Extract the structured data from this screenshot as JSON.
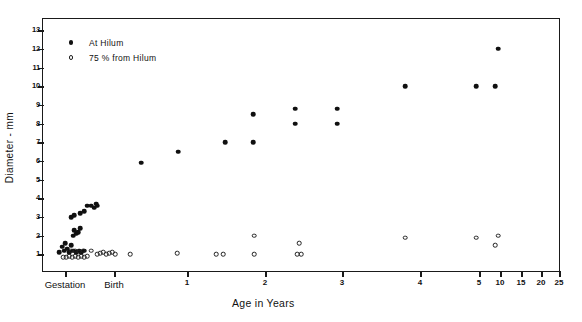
{
  "chart_data": {
    "type": "scatter",
    "title": "",
    "xlabel": "Age in Years",
    "ylabel": "Diameter - mm",
    "ylim": [
      0,
      13.6
    ],
    "ytick_labels": [
      "1",
      "2",
      "3",
      "4",
      "5",
      "6",
      "7",
      "8",
      "9",
      "10",
      "11",
      "12",
      "13"
    ],
    "ytick_values": [
      1,
      2,
      3,
      4,
      5,
      6,
      7,
      8,
      9,
      10,
      11,
      12,
      13
    ],
    "xtick_labels": [
      "Gestation",
      "Birth",
      "1",
      "2",
      "3",
      "4",
      "5",
      "10",
      "15",
      "20",
      "25"
    ],
    "xtick_positions_px": [
      64,
      113,
      186,
      264,
      341,
      419,
      478,
      499,
      520,
      540,
      558
    ],
    "grid": false,
    "legend_position": "top-left",
    "series": [
      {
        "name": "At Hilum",
        "marker": "filled-circle",
        "points": [
          {
            "x_px": 58,
            "y": 1.1
          },
          {
            "x_px": 61,
            "y": 1.4
          },
          {
            "x_px": 63,
            "y": 1.2
          },
          {
            "x_px": 64,
            "y": 1.6
          },
          {
            "x_px": 66,
            "y": 1.3
          },
          {
            "x_px": 68,
            "y": 1.1
          },
          {
            "x_px": 70,
            "y": 1.5
          },
          {
            "x_px": 72,
            "y": 1.2
          },
          {
            "x_px": 75,
            "y": 1.1
          },
          {
            "x_px": 78,
            "y": 1.2
          },
          {
            "x_px": 80,
            "y": 1.1
          },
          {
            "x_px": 83,
            "y": 1.2
          },
          {
            "x_px": 72,
            "y": 2.0
          },
          {
            "x_px": 75,
            "y": 2.1
          },
          {
            "x_px": 77,
            "y": 2.2
          },
          {
            "x_px": 79,
            "y": 2.4
          },
          {
            "x_px": 73,
            "y": 2.3
          },
          {
            "x_px": 70,
            "y": 3.0
          },
          {
            "x_px": 73,
            "y": 3.1
          },
          {
            "x_px": 79,
            "y": 3.2
          },
          {
            "x_px": 83,
            "y": 3.3
          },
          {
            "x_px": 86,
            "y": 3.6
          },
          {
            "x_px": 90,
            "y": 3.6
          },
          {
            "x_px": 93,
            "y": 3.5
          },
          {
            "x_px": 95,
            "y": 3.7
          },
          {
            "x_px": 96,
            "y": 3.6
          },
          {
            "x_px": 140,
            "y": 5.9
          },
          {
            "x_px": 177,
            "y": 6.5
          },
          {
            "x_px": 224,
            "y": 7.0
          },
          {
            "x_px": 252,
            "y": 7.0
          },
          {
            "x_px": 252,
            "y": 8.5
          },
          {
            "x_px": 294,
            "y": 8.0
          },
          {
            "x_px": 294,
            "y": 8.8
          },
          {
            "x_px": 336,
            "y": 8.0
          },
          {
            "x_px": 336,
            "y": 8.8
          },
          {
            "x_px": 404,
            "y": 10.0
          },
          {
            "x_px": 475,
            "y": 10.0
          },
          {
            "x_px": 494,
            "y": 10.0
          },
          {
            "x_px": 497,
            "y": 12.0
          }
        ]
      },
      {
        "name": "75 % from Hilum",
        "marker": "open-circle",
        "points": [
          {
            "x_px": 62,
            "y": 0.85
          },
          {
            "x_px": 65,
            "y": 0.85
          },
          {
            "x_px": 68,
            "y": 0.9
          },
          {
            "x_px": 71,
            "y": 0.85
          },
          {
            "x_px": 74,
            "y": 0.9
          },
          {
            "x_px": 77,
            "y": 0.85
          },
          {
            "x_px": 80,
            "y": 0.9
          },
          {
            "x_px": 83,
            "y": 0.85
          },
          {
            "x_px": 86,
            "y": 0.9
          },
          {
            "x_px": 70,
            "y": 1.2
          },
          {
            "x_px": 74,
            "y": 1.2
          },
          {
            "x_px": 78,
            "y": 1.15
          },
          {
            "x_px": 82,
            "y": 1.2
          },
          {
            "x_px": 90,
            "y": 1.2
          },
          {
            "x_px": 96,
            "y": 1.0
          },
          {
            "x_px": 99,
            "y": 1.05
          },
          {
            "x_px": 102,
            "y": 1.1
          },
          {
            "x_px": 105,
            "y": 1.0
          },
          {
            "x_px": 108,
            "y": 1.05
          },
          {
            "x_px": 111,
            "y": 1.1
          },
          {
            "x_px": 114,
            "y": 1.0
          },
          {
            "x_px": 129,
            "y": 1.0
          },
          {
            "x_px": 176,
            "y": 1.05
          },
          {
            "x_px": 215,
            "y": 1.0
          },
          {
            "x_px": 222,
            "y": 1.0
          },
          {
            "x_px": 253,
            "y": 1.0
          },
          {
            "x_px": 253,
            "y": 2.0
          },
          {
            "x_px": 296,
            "y": 1.0
          },
          {
            "x_px": 300,
            "y": 1.0
          },
          {
            "x_px": 298,
            "y": 1.6
          },
          {
            "x_px": 404,
            "y": 1.9
          },
          {
            "x_px": 475,
            "y": 1.9
          },
          {
            "x_px": 497,
            "y": 2.0
          },
          {
            "x_px": 494,
            "y": 1.5
          }
        ]
      }
    ],
    "legend": [
      {
        "label": "At Hilum",
        "marker": "filled-circle"
      },
      {
        "label": "75 % from Hilum",
        "marker": "open-circle"
      }
    ]
  }
}
